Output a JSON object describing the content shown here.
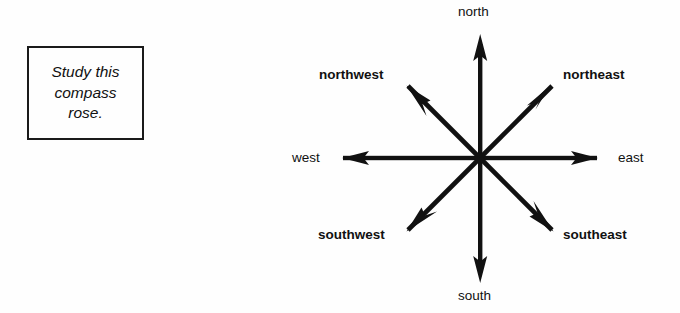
{
  "page": {
    "background_color": "#fefefe",
    "ink_color": "#111111",
    "width": 680,
    "height": 313
  },
  "instruction": {
    "text": "Study this\ncompass\nrose.",
    "style": "italic",
    "border_color": "#1a1a1a"
  },
  "compass": {
    "title": "compass rose",
    "center": {
      "x": 480,
      "y": 158
    },
    "stroke_color": "#111111",
    "labels": {
      "north": "north",
      "south": "south",
      "east": "east",
      "west": "west",
      "northwest": "northwest",
      "northeast": "northeast",
      "southwest": "southwest",
      "southeast": "southeast"
    },
    "directions": [
      {
        "name": "north",
        "abbr": "N",
        "bearing_deg": 0,
        "kind": "cardinal"
      },
      {
        "name": "northeast",
        "abbr": "NE",
        "bearing_deg": 45,
        "kind": "intercardinal"
      },
      {
        "name": "east",
        "abbr": "E",
        "bearing_deg": 90,
        "kind": "cardinal"
      },
      {
        "name": "southeast",
        "abbr": "SE",
        "bearing_deg": 135,
        "kind": "intercardinal"
      },
      {
        "name": "south",
        "abbr": "S",
        "bearing_deg": 180,
        "kind": "cardinal"
      },
      {
        "name": "southwest",
        "abbr": "SW",
        "bearing_deg": 225,
        "kind": "intercardinal"
      },
      {
        "name": "west",
        "abbr": "W",
        "bearing_deg": 270,
        "kind": "cardinal"
      },
      {
        "name": "northwest",
        "abbr": "NW",
        "bearing_deg": 315,
        "kind": "intercardinal"
      }
    ]
  }
}
